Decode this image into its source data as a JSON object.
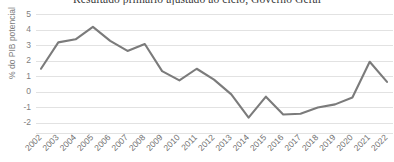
{
  "chart_data": {
    "type": "line",
    "title": "Resultado primário ajustado ao ciclo, Governo Geral",
    "subtitle": "",
    "xlabel": "",
    "ylabel": "% do PIB potencial",
    "categories": [
      "2002",
      "2003",
      "2004",
      "2005",
      "2006",
      "2007",
      "2008",
      "2009",
      "2010",
      "2011",
      "2012",
      "2013",
      "2014",
      "2015",
      "2016",
      "2017",
      "2018",
      "2019",
      "2020",
      "2021",
      "2022"
    ],
    "values": [
      1.5,
      3.2,
      3.4,
      4.2,
      3.3,
      2.65,
      3.1,
      1.35,
      0.75,
      1.5,
      0.8,
      -0.15,
      -1.65,
      -0.3,
      -1.45,
      -1.4,
      -1.0,
      -0.8,
      -0.35,
      1.95,
      0.65
    ],
    "series": [
      {
        "name": "Resultado primário ajustado ao ciclo",
        "values": [
          1.5,
          3.2,
          3.4,
          4.2,
          3.3,
          2.65,
          3.1,
          1.35,
          0.75,
          1.5,
          0.8,
          -0.15,
          -1.65,
          -0.3,
          -1.45,
          -1.4,
          -1.0,
          -0.8,
          -0.35,
          1.95,
          0.65
        ]
      }
    ],
    "ylim": [
      -2,
      5
    ],
    "ytick_labels": [
      "5",
      "4",
      "3",
      "2",
      "1",
      "0",
      "-1",
      "-2"
    ],
    "ytick_values": [
      5,
      4,
      3,
      2,
      1,
      0,
      -1,
      -2
    ],
    "grid": true,
    "grid_axis": "y",
    "legend": false,
    "legend_position": "none",
    "line_color": "#7b7b7b",
    "grid_color": "#e2e2e2",
    "tick_label_color": "#808080",
    "background_color": "#ffffff",
    "xtick_rotation": -45
  }
}
